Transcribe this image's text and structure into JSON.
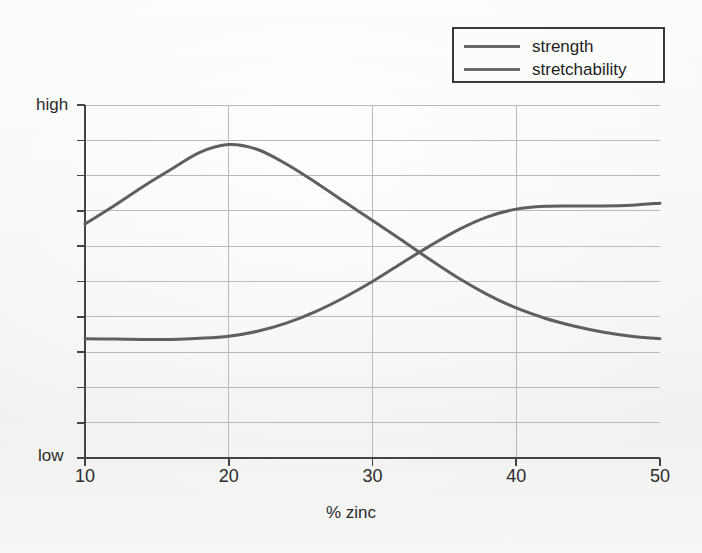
{
  "chart_data": {
    "type": "line",
    "title": "",
    "xlabel": "% zinc",
    "ylabel": "",
    "xlim": [
      10,
      50
    ],
    "ylim": [
      0,
      1
    ],
    "grid": true,
    "legend_position": "top-right",
    "x_ticks": [
      "10",
      "20",
      "30",
      "40",
      "50"
    ],
    "x_tick_values": [
      10,
      20,
      30,
      40,
      50
    ],
    "y_ticks": [
      "low",
      "high"
    ],
    "y_tick_values": [
      0,
      1
    ],
    "y_axis_note": "qualitative scale from low to high",
    "line_color": "#5f5f5f",
    "grid_color": "#b9b9b9",
    "axis_color": "#444444",
    "series": [
      {
        "name": "strength",
        "color": "#5f5f5f",
        "x": [
          10,
          12,
          14,
          16,
          18,
          20,
          22,
          24,
          26,
          28,
          30,
          32,
          34,
          36,
          38,
          40,
          42,
          44,
          46,
          48,
          50
        ],
        "values": [
          0.663,
          0.714,
          0.768,
          0.818,
          0.866,
          0.888,
          0.874,
          0.833,
          0.782,
          0.727,
          0.673,
          0.618,
          0.562,
          0.509,
          0.463,
          0.425,
          0.396,
          0.374,
          0.357,
          0.345,
          0.338
        ]
      },
      {
        "name": "stretchability",
        "color": "#5f5f5f",
        "x": [
          10,
          12,
          14,
          16,
          18,
          20,
          22,
          24,
          26,
          28,
          30,
          32,
          34,
          36,
          38,
          40,
          42,
          44,
          46,
          48,
          50
        ],
        "values": [
          0.338,
          0.337,
          0.336,
          0.336,
          0.339,
          0.345,
          0.359,
          0.382,
          0.414,
          0.454,
          0.5,
          0.551,
          0.601,
          0.647,
          0.683,
          0.705,
          0.713,
          0.714,
          0.714,
          0.716,
          0.722
        ]
      }
    ],
    "annotations": {
      "strength_peak_x": 20,
      "crossing_x": 34.5
    }
  },
  "legend": {
    "items": [
      {
        "label": "strength"
      },
      {
        "label": "stretchability"
      }
    ]
  },
  "axes": {
    "y_high_label": "high",
    "y_low_label": "low",
    "x_title": "% zinc"
  }
}
